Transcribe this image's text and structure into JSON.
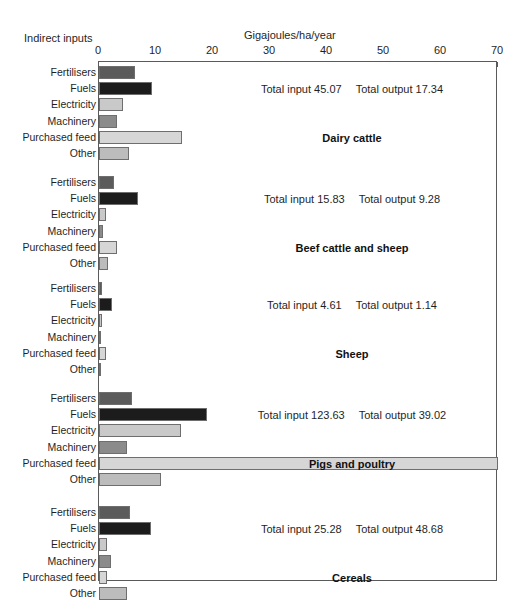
{
  "header": {
    "indirect_inputs_label": "Indirect inputs",
    "axis_title": "Gigajoules/ha/year"
  },
  "axis": {
    "ticks": [
      0,
      10,
      20,
      30,
      40,
      50,
      60,
      70
    ],
    "tick_labels": [
      "0",
      "10",
      "20",
      "30",
      "40",
      "50",
      "60",
      "70"
    ],
    "min": 0,
    "max": 70
  },
  "labels": {
    "total_input_prefix": "Total input",
    "total_output_prefix": "Total output"
  },
  "colors": {
    "fertilisers": "#5b5b5b",
    "fuels": "#1c1c1c",
    "electricity": "#c9c9c9",
    "machinery": "#8b8b8b",
    "purchased_feed": "#d6d6d6",
    "other": "#bcbcbc",
    "axis": "#5a5a5a",
    "text": "#1f1f1f"
  },
  "chart_data": {
    "type": "bar",
    "title": "",
    "xlabel": "Gigajoules/ha/year",
    "ylabel": "Indirect inputs",
    "xlim": [
      0,
      70
    ],
    "grid": false,
    "legend": "none",
    "orientation": "horizontal",
    "categories": [
      "Fertilisers",
      "Fuels",
      "Electricity",
      "Machinery",
      "Purchased feed",
      "Other"
    ],
    "groups": [
      {
        "name": "Dairy cattle",
        "total_input": "45.07",
        "total_output": "17.34",
        "values": [
          6.3,
          9.3,
          4.2,
          3.1,
          14.6,
          5.3
        ]
      },
      {
        "name": "Beef cattle and sheep",
        "total_input": "15.83",
        "total_output": "9.28",
        "values": [
          2.6,
          6.8,
          1.2,
          0.7,
          3.2,
          1.6
        ]
      },
      {
        "name": "Sheep",
        "total_input": "4.61",
        "total_output": "1.14",
        "values": [
          0.6,
          2.3,
          0.5,
          0.3,
          1.2,
          0.4
        ]
      },
      {
        "name": "Pigs and poultry",
        "total_input": "123.63",
        "total_output": "39.02",
        "values": [
          5.8,
          19.0,
          14.4,
          4.9,
          70.0,
          10.9
        ]
      },
      {
        "name": "Cereals",
        "total_input": "25.28",
        "total_output": "48.68",
        "values": [
          5.4,
          9.1,
          1.4,
          2.1,
          1.4,
          4.9
        ]
      }
    ]
  }
}
